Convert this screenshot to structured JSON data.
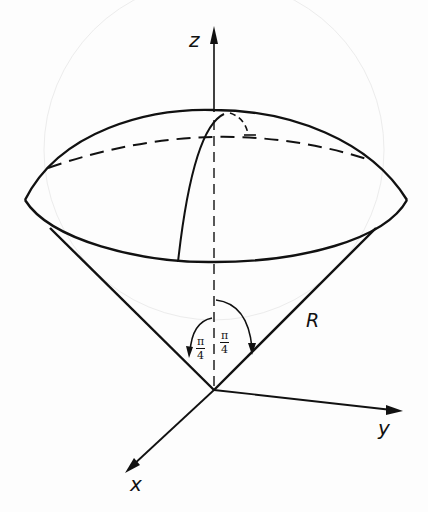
{
  "diagram": {
    "axes": {
      "x_label": "x",
      "y_label": "y",
      "z_label": "z"
    },
    "radius_label": "R",
    "angles": [
      {
        "numerator": "π",
        "denominator": "4",
        "side": "left"
      },
      {
        "numerator": "π",
        "denominator": "4",
        "side": "right"
      }
    ],
    "colors": {
      "stroke": "#111111",
      "background": "#fdfdfd",
      "ghost": "#e6e6e6"
    }
  }
}
